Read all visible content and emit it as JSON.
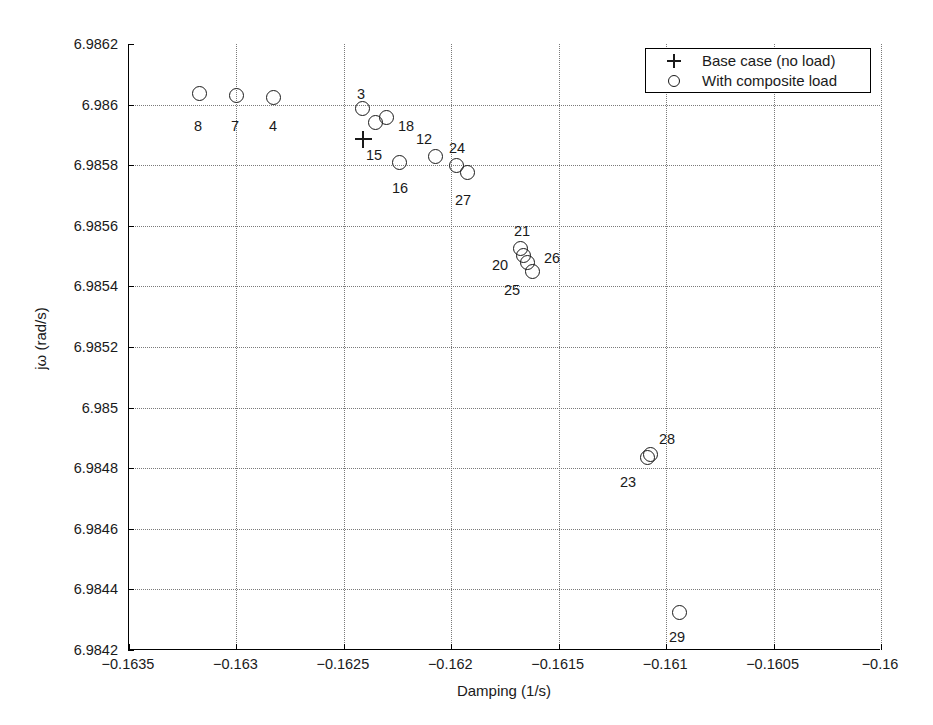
{
  "chart_data": {
    "type": "scatter",
    "title": "",
    "xlabel": "Damping (1/s)",
    "ylabel": "jω (rad/s)",
    "xlim": [
      -0.1635,
      -0.16
    ],
    "ylim": [
      6.9842,
      6.9862
    ],
    "xticks": [
      "-0.1635",
      "-0.163",
      "-0.1625",
      "-0.162",
      "-0.1615",
      "-0.161",
      "-0.1605",
      "-0.16"
    ],
    "xtick_values": [
      -0.1635,
      -0.163,
      -0.1625,
      -0.162,
      -0.1615,
      -0.161,
      -0.1605,
      -0.16
    ],
    "yticks": [
      "6.9842",
      "6.9844",
      "6.9846",
      "6.9848",
      "6.985",
      "6.9852",
      "6.9854",
      "6.9856",
      "6.9858",
      "6.986",
      "6.9862"
    ],
    "ytick_values": [
      6.9842,
      6.9844,
      6.9846,
      6.9848,
      6.985,
      6.9852,
      6.9854,
      6.9856,
      6.9858,
      6.986,
      6.9862
    ],
    "grid": true,
    "legend_position": "upper right",
    "legend": [
      {
        "symbol": "+",
        "label": "Base case (no load)"
      },
      {
        "symbol": "o",
        "label": "With composite load"
      }
    ],
    "series": [
      {
        "name": "Base case (no load)",
        "marker": "plus",
        "points": [
          {
            "label": "15",
            "x": -0.16341,
            "y": 6.9859,
            "px": 362,
            "py": 139,
            "lx": 373,
            "ly": 155
          }
        ]
      },
      {
        "name": "With composite load",
        "marker": "circle",
        "points": [
          {
            "label": "8",
            "x": -0.16317,
            "y": 6.98603,
            "px": 198,
            "py": 93,
            "lx": 197,
            "ly": 126
          },
          {
            "label": "7",
            "x": -0.163,
            "y": 6.98602,
            "px": 235,
            "py": 95,
            "lx": 234,
            "ly": 126
          },
          {
            "label": "4",
            "x": -0.16283,
            "y": 6.98601,
            "px": 272,
            "py": 97,
            "lx": 272,
            "ly": 126
          },
          {
            "label": "3",
            "x": -0.16239,
            "y": 6.98598,
            "px": 361,
            "py": 108,
            "lx": 360,
            "ly": 94
          },
          {
            "label": "18",
            "x": -0.16228,
            "y": 6.98594,
            "px": 385,
            "py": 117,
            "lx": 405,
            "ly": 126
          },
          {
            "label": "",
            "x": -0.16233,
            "y": 6.98593,
            "px": 374,
            "py": 122,
            "lx": 0,
            "ly": 0
          },
          {
            "label": "16",
            "x": -0.16221,
            "y": 6.9858,
            "px": 398,
            "py": 162,
            "lx": 399,
            "ly": 188
          },
          {
            "label": "12",
            "x": -0.16204,
            "y": 6.98582,
            "px": 434,
            "py": 156,
            "lx": 423,
            "ly": 139
          },
          {
            "label": "24",
            "x": -0.16194,
            "y": 6.98579,
            "px": 455,
            "py": 165,
            "lx": 456,
            "ly": 148
          },
          {
            "label": "27",
            "x": -0.16189,
            "y": 6.98577,
            "px": 466,
            "py": 172,
            "lx": 462,
            "ly": 200
          },
          {
            "label": "21",
            "x": -0.16163,
            "y": 6.98551,
            "px": 519,
            "py": 248,
            "lx": 521,
            "ly": 231
          },
          {
            "label": "20",
            "x": -0.16162,
            "y": 6.98549,
            "px": 522,
            "py": 255,
            "lx": 499,
            "ly": 265
          },
          {
            "label": "26",
            "x": -0.1616,
            "y": 6.98547,
            "px": 526,
            "py": 262,
            "lx": 551,
            "ly": 258
          },
          {
            "label": "25",
            "x": -0.16158,
            "y": 6.98544,
            "px": 531,
            "py": 271,
            "lx": 511,
            "ly": 290
          },
          {
            "label": "23",
            "x": -0.16108,
            "y": 6.98481,
            "px": 646,
            "py": 457,
            "lx": 627,
            "ly": 482
          },
          {
            "label": "28",
            "x": -0.16107,
            "y": 6.98482,
            "px": 649,
            "py": 454,
            "lx": 666,
            "ly": 439
          },
          {
            "label": "29",
            "x": -0.15911,
            "y": 6.98432,
            "px": 678,
            "py": 612,
            "lx": 676,
            "ly": 637
          }
        ]
      }
    ]
  }
}
